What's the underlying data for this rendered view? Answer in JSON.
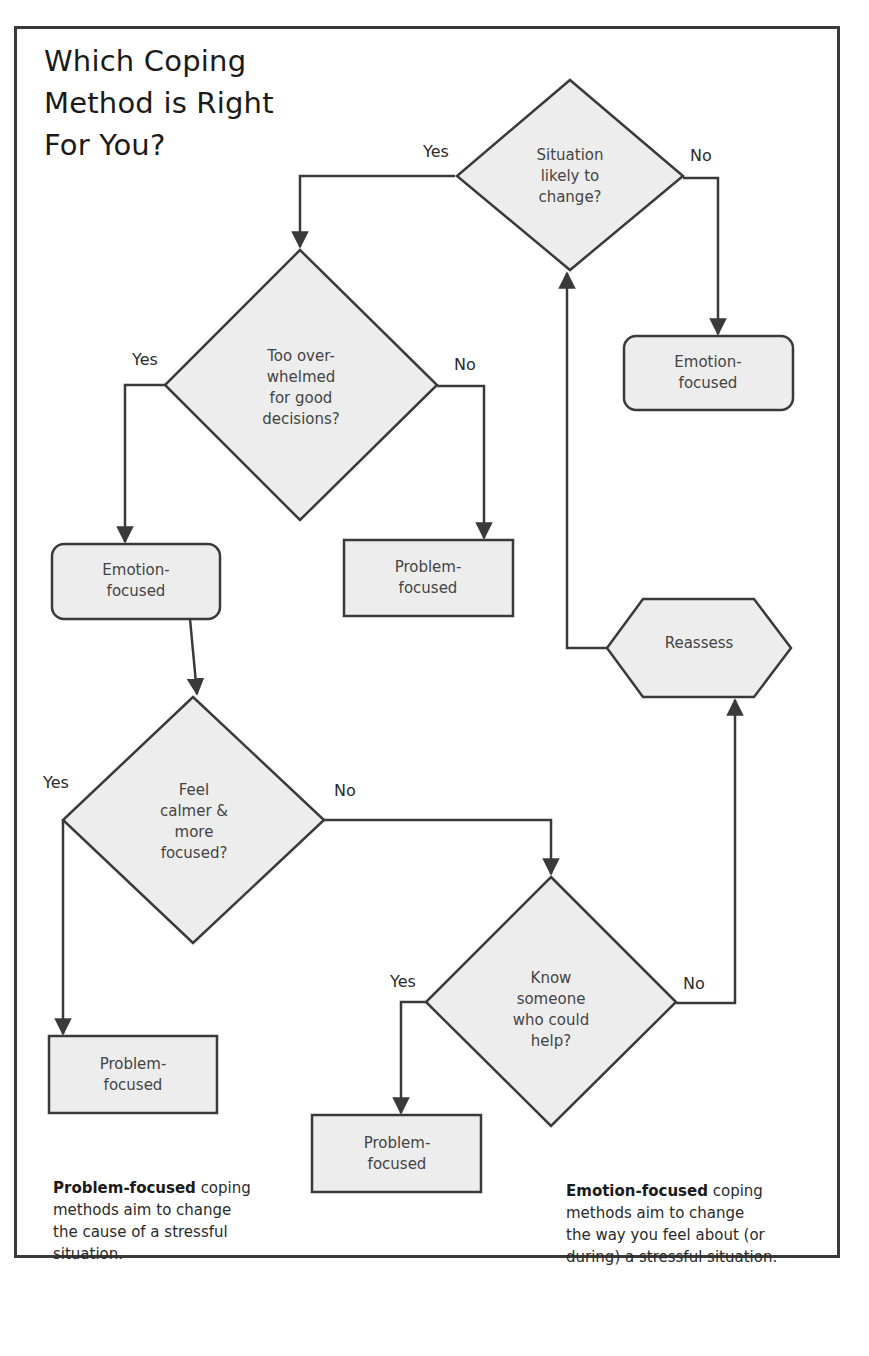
{
  "title": {
    "lines": [
      "Which Coping",
      "Method is Right",
      "For You?"
    ]
  },
  "colors": {
    "stroke": "#3a3a3a",
    "fill": "#ededed",
    "background": "#ffffff"
  },
  "nodes": {
    "situation_change": {
      "type": "decision",
      "lines": [
        "Situation",
        "likely to",
        "change?"
      ]
    },
    "emotion_focused_top": {
      "type": "rounded-box",
      "lines": [
        "Emotion-",
        "focused"
      ]
    },
    "overwhelmed": {
      "type": "decision",
      "lines": [
        "Too over-",
        "whelmed",
        "for good",
        "decisions?"
      ]
    },
    "emotion_focused_left": {
      "type": "rounded-box",
      "lines": [
        "Emotion-",
        "focused"
      ]
    },
    "problem_focused_mid": {
      "type": "box",
      "lines": [
        "Problem-",
        "focused"
      ]
    },
    "reassess": {
      "type": "hexagon",
      "lines": [
        "Reassess"
      ]
    },
    "calmer": {
      "type": "decision",
      "lines": [
        "Feel",
        "calmer &",
        "more",
        "focused?"
      ]
    },
    "know_someone": {
      "type": "decision",
      "lines": [
        "Know",
        "someone",
        "who could",
        "help?"
      ]
    },
    "problem_focused_left": {
      "type": "box",
      "lines": [
        "Problem-",
        "focused"
      ]
    },
    "problem_focused_bottom": {
      "type": "box",
      "lines": [
        "Problem-",
        "focused"
      ]
    }
  },
  "edge_labels": {
    "situation_yes": "Yes",
    "situation_no": "No",
    "overwhelmed_yes": "Yes",
    "overwhelmed_no": "No",
    "calmer_yes": "Yes",
    "calmer_no": "No",
    "know_yes": "Yes",
    "know_no": "No"
  },
  "notes": {
    "problem": {
      "bold": "Problem-focused",
      "rest": " coping",
      "lines": [
        "methods aim to change",
        "the cause of a stressful",
        "situation."
      ]
    },
    "emotion": {
      "bold": "Emotion-focused",
      "rest": " coping",
      "lines": [
        "methods aim to change",
        "the way you feel about (or",
        "during) a stressful situation."
      ]
    }
  }
}
